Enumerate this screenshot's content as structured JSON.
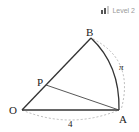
{
  "badge": {
    "level_label": "Level 2",
    "bars_filled": 2,
    "bars_total": 3
  },
  "diagram": {
    "type": "sector",
    "points": {
      "O": "O",
      "A": "A",
      "B": "B",
      "P": "P"
    },
    "radius_label": "4",
    "arc_label": "π",
    "segments": [
      "OA",
      "OB",
      "PA"
    ],
    "arc": "AB"
  }
}
